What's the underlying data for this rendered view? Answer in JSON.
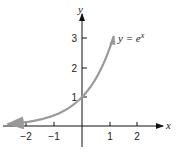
{
  "chart_data": {
    "type": "line",
    "title": "",
    "xlabel": "x",
    "ylabel": "y",
    "xlim": [
      -2.7,
      2.8
    ],
    "ylim": [
      -0.6,
      3.6
    ],
    "xticks": [
      -2,
      -1,
      1,
      2
    ],
    "xtick_labels": [
      "−2",
      "−1",
      "1",
      "2"
    ],
    "yticks": [
      1,
      2,
      3
    ],
    "ytick_labels": [
      "1",
      "2",
      "3"
    ],
    "grid": false,
    "legend": null,
    "series": [
      {
        "name": "y = e^x",
        "equation": "y = e^x",
        "color": "#9a9a9a",
        "x": [
          -2.6,
          -2,
          -1.5,
          -1,
          -0.5,
          0,
          0.25,
          0.5,
          0.75,
          1,
          1.1
        ],
        "y": [
          0.074,
          0.135,
          0.223,
          0.368,
          0.607,
          1.0,
          1.284,
          1.649,
          2.117,
          2.718,
          3.004
        ]
      }
    ],
    "annotations": [
      {
        "text": "y = e",
        "superscript": "x",
        "near": [
          1.3,
          3.0
        ]
      }
    ]
  },
  "labels": {
    "x_axis": "x",
    "y_axis": "y",
    "curve_label_main": "y = e",
    "curve_label_sup": "x",
    "xt0": "−2",
    "xt1": "−1",
    "xt2": "1",
    "xt3": "2",
    "yt0": "1",
    "yt1": "2",
    "yt2": "3"
  }
}
